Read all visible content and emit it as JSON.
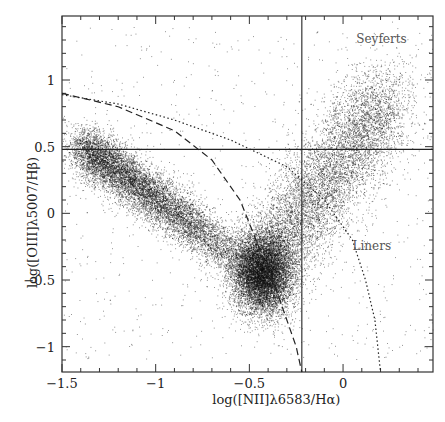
{
  "chart_data": {
    "type": "scatter",
    "title": "",
    "xlabel": "log([NII]λ6583/Hα)",
    "ylabel": "log([OIII]λ5007/Hβ)",
    "xlim": [
      -1.5,
      0.48
    ],
    "ylim": [
      -1.19,
      1.48
    ],
    "xticks": [
      -1.5,
      -1,
      -0.5,
      0
    ],
    "xtick_labels": [
      "−1.5",
      "−1",
      "−0.5",
      "0"
    ],
    "yticks": [
      -1,
      -0.5,
      0,
      0.5,
      1
    ],
    "ytick_labels": [
      "−1",
      "−0.5",
      "0",
      "0.5",
      "1"
    ],
    "grid": false,
    "legend": null,
    "annotations": [
      {
        "text": "Seyferts",
        "x": 0.22,
        "y": 1.3
      },
      {
        "text": "Liners",
        "x": 0.2,
        "y": -0.25
      }
    ],
    "reference_lines": [
      {
        "type": "vertical",
        "x": -0.22,
        "style": "solid"
      },
      {
        "type": "horizontal",
        "y": 0.48,
        "style": "solid"
      },
      {
        "type": "curve",
        "style": "dashed",
        "name": "Kauffmann",
        "points": [
          [
            -1.5,
            0.9
          ],
          [
            -1.2,
            0.8
          ],
          [
            -0.9,
            0.62
          ],
          [
            -0.7,
            0.4
          ],
          [
            -0.55,
            0.1
          ],
          [
            -0.45,
            -0.25
          ],
          [
            -0.35,
            -0.6
          ],
          [
            -0.25,
            -1.0
          ],
          [
            -0.22,
            -1.19
          ]
        ]
      },
      {
        "type": "curve",
        "style": "dotted",
        "name": "Kewley",
        "points": [
          [
            -1.5,
            0.89
          ],
          [
            -1.2,
            0.82
          ],
          [
            -0.9,
            0.7
          ],
          [
            -0.6,
            0.55
          ],
          [
            -0.3,
            0.35
          ],
          [
            -0.1,
            0.1
          ],
          [
            0.05,
            -0.2
          ],
          [
            0.12,
            -0.5
          ],
          [
            0.17,
            -0.8
          ],
          [
            0.2,
            -1.19
          ]
        ]
      }
    ],
    "density_description": "Dense seagull-shaped point cloud; star-forming branch from (-1.4,0.5) down to (-0.45,-0.5); AGN branch rising from (-0.4,-0.5) to (0.2,0.9)"
  }
}
